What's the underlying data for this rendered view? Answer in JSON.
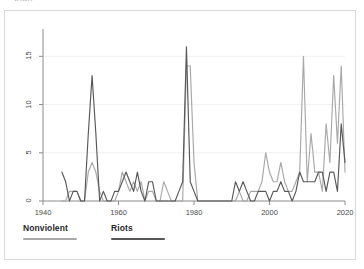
{
  "clipped_title": "than",
  "colors": {
    "nonviolent": "#a8a8a8",
    "riots": "#585858",
    "axis": "#8c8c8c",
    "grid": "#f0f0f0",
    "card_border": "#d8d8d8",
    "background": "#ffffff",
    "tick_text": "#4a4a4a"
  },
  "legend": {
    "items": [
      {
        "label": "Nonviolent",
        "color": "#a8a8a8"
      },
      {
        "label": "Riots",
        "color": "#585858"
      }
    ]
  },
  "axes": {
    "y_ticks": [
      "0",
      "5",
      "10",
      "15"
    ],
    "x_ticks": [
      "1940",
      "1960",
      "1980",
      "2000",
      "2020"
    ]
  },
  "chart_data": {
    "type": "line",
    "title": "",
    "subtitle": "",
    "xlabel": "",
    "ylabel": "",
    "xlim": [
      1940,
      2020
    ],
    "ylim": [
      0,
      16.8
    ],
    "grid": true,
    "legend_position": "bottom-left",
    "x": [
      1945,
      1946,
      1947,
      1948,
      1949,
      1950,
      1951,
      1952,
      1953,
      1954,
      1955,
      1956,
      1957,
      1958,
      1959,
      1960,
      1961,
      1962,
      1963,
      1964,
      1965,
      1966,
      1967,
      1968,
      1969,
      1970,
      1971,
      1972,
      1973,
      1974,
      1975,
      1976,
      1977,
      1978,
      1979,
      1980,
      1981,
      1982,
      1983,
      1984,
      1985,
      1986,
      1987,
      1988,
      1989,
      1990,
      1991,
      1992,
      1993,
      1994,
      1995,
      1996,
      1997,
      1998,
      1999,
      2000,
      2001,
      2002,
      2003,
      2004,
      2005,
      2006,
      2007,
      2008,
      2009,
      2010,
      2011,
      2012,
      2013,
      2014,
      2015,
      2016,
      2017,
      2018,
      2019,
      2020
    ],
    "series": [
      {
        "name": "Nonviolent",
        "color": "#a8a8a8",
        "values": [
          0,
          0,
          1,
          1,
          1,
          0,
          0,
          3,
          4,
          3,
          1,
          0,
          0,
          0,
          0,
          1,
          3,
          2,
          1,
          2,
          1,
          2,
          0,
          1,
          1,
          0,
          0,
          2,
          1,
          0,
          0,
          0,
          0,
          14,
          14,
          4,
          0,
          0,
          0,
          0,
          0,
          0,
          0,
          0,
          0,
          0,
          0,
          1,
          0,
          0,
          1,
          1,
          1,
          2,
          5,
          3,
          2,
          2,
          4,
          2,
          1,
          1,
          2,
          3,
          15,
          2,
          7,
          3,
          3,
          1,
          8,
          4,
          13,
          6,
          14,
          3
        ]
      },
      {
        "name": "Riots",
        "color": "#585858",
        "values": [
          3,
          2,
          0,
          1,
          1,
          0,
          0,
          7,
          13,
          7,
          0,
          1,
          0,
          0,
          1,
          1,
          2,
          3,
          2,
          1,
          3,
          1,
          0,
          2,
          2,
          0,
          0,
          0,
          0,
          0,
          0,
          1,
          2,
          16,
          2,
          1,
          0,
          0,
          0,
          0,
          0,
          0,
          0,
          0,
          0,
          0,
          2,
          1,
          2,
          1,
          0,
          0,
          1,
          1,
          1,
          0,
          1,
          1,
          2,
          1,
          1,
          0,
          1,
          3,
          2,
          2,
          2,
          2,
          3,
          3,
          1,
          3,
          3,
          1,
          8,
          4
        ]
      }
    ]
  }
}
